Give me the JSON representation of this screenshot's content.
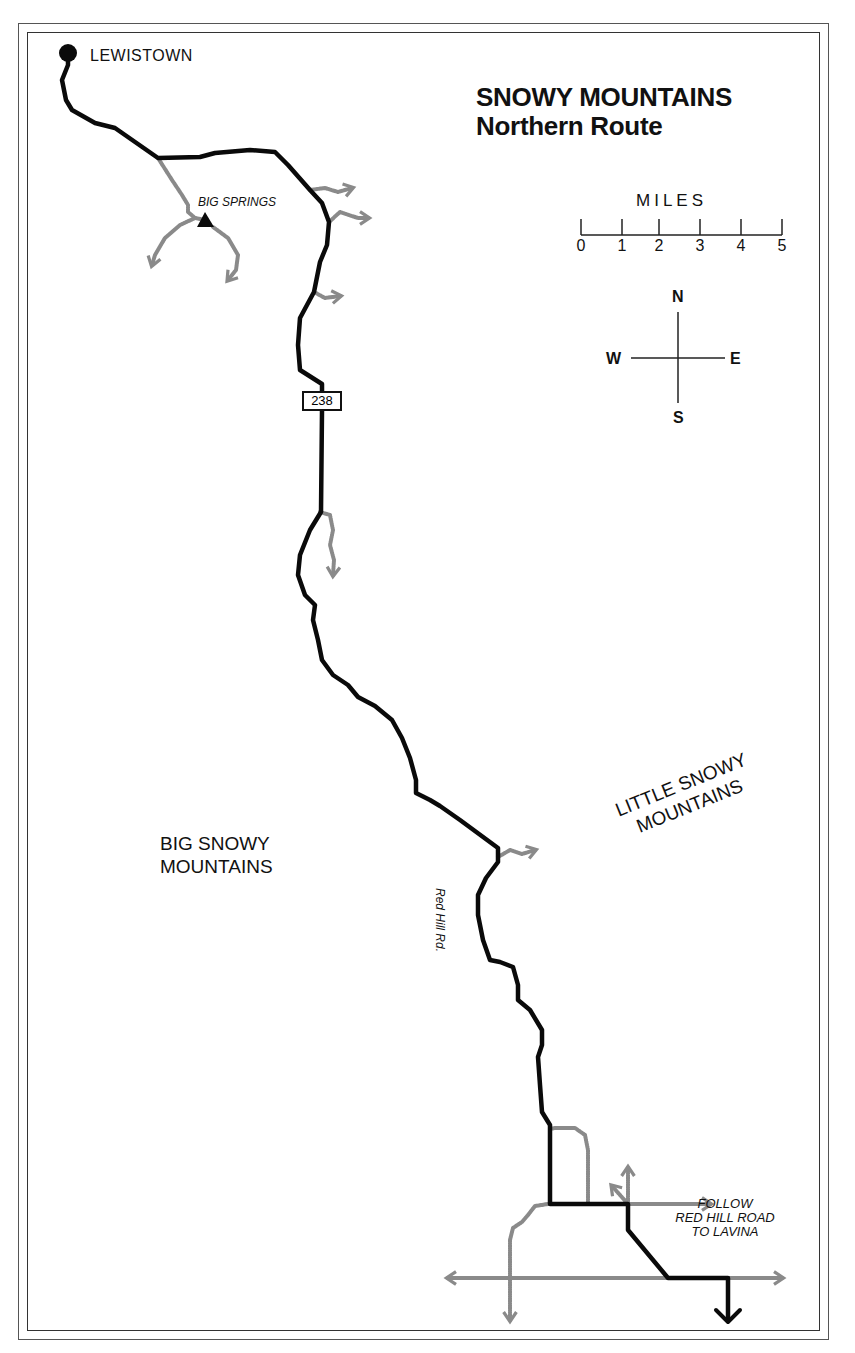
{
  "title": {
    "line1": "SNOWY MOUNTAINS",
    "line2": "Northern Route"
  },
  "places": {
    "start_town": "LEWISTOWN",
    "landmark": "BIG SPRINGS",
    "region_west": [
      "BIG SNOWY",
      "MOUNTAINS"
    ],
    "region_east": [
      "LITTLE SNOWY",
      "MOUNTAINS"
    ]
  },
  "roads": {
    "highway_shield": "238",
    "road_label": "Red Hill Rd.",
    "directions_note": [
      "FOLLOW",
      "RED HILL ROAD",
      "TO LAVINA"
    ]
  },
  "scale_bar": {
    "unit_label": "MILES",
    "ticks": [
      "0",
      "1",
      "2",
      "3",
      "4",
      "5"
    ]
  },
  "compass": {
    "north": "N",
    "south": "S",
    "east": "E",
    "west": "W"
  },
  "colors": {
    "main_route": "#0a0a0a",
    "side_roads": "#8a8a8a",
    "background": "#ffffff"
  }
}
